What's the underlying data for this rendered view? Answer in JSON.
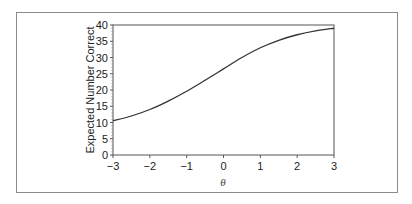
{
  "chart_data": {
    "type": "line",
    "title": "",
    "xlabel": "θ",
    "ylabel": "Expected Number Correct",
    "xlim": [
      -3,
      3
    ],
    "ylim": [
      0,
      40
    ],
    "x_ticks": [
      "−3",
      "−2",
      "−1",
      "0",
      "1",
      "2",
      "3"
    ],
    "y_ticks": [
      "0",
      "5",
      "10",
      "15",
      "20",
      "25",
      "30",
      "35",
      "40"
    ],
    "grid": false,
    "legend": null,
    "series": [
      {
        "name": "Test characteristic curve",
        "x": [
          -3,
          -2.5,
          -2,
          -1.5,
          -1,
          -0.5,
          0,
          0.5,
          1,
          1.5,
          2,
          2.5,
          3
        ],
        "values": [
          10.5,
          12.0,
          14.0,
          16.6,
          19.6,
          23.0,
          26.5,
          30.0,
          33.0,
          35.3,
          37.0,
          38.2,
          39.0
        ]
      }
    ]
  }
}
